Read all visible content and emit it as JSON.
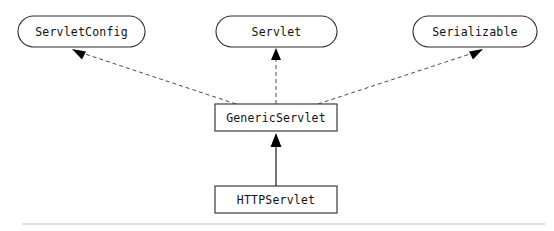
{
  "diagram": {
    "type": "uml-class-hierarchy",
    "canvas": {
      "width": 554,
      "height": 231,
      "background": "#ffffff"
    },
    "colors": {
      "node_stroke": "#2b2b2b",
      "node_fill": "#ffffff",
      "label_text": "#111111",
      "dashed_edge": "#4a4a4a",
      "solid_edge": "#2b2b2b",
      "arrowhead": "#000000",
      "footer_rule": "#b9b9b9"
    },
    "interfaces": [
      {
        "id": "servlet-config",
        "label": "ServletConfig",
        "shape": "rounded-oval",
        "x": 18,
        "y": 16,
        "w": 127,
        "h": 31,
        "cx": 81.5,
        "cy": 31.5
      },
      {
        "id": "servlet",
        "label": "Servlet",
        "shape": "rounded-oval",
        "x": 216,
        "y": 16,
        "w": 121,
        "h": 31,
        "cx": 276.5,
        "cy": 31.5
      },
      {
        "id": "serializable",
        "label": "Serializable",
        "shape": "rounded-oval",
        "x": 413,
        "y": 16,
        "w": 124,
        "h": 31,
        "cx": 475,
        "cy": 31.5
      }
    ],
    "classes": [
      {
        "id": "generic-servlet",
        "label": "GenericServlet",
        "shape": "rectangle",
        "x": 215,
        "y": 104,
        "w": 122,
        "h": 27,
        "cx": 276,
        "cy": 117.5
      },
      {
        "id": "http-servlet",
        "label": "HTTPServlet",
        "shape": "rectangle",
        "x": 215,
        "y": 186,
        "w": 122,
        "h": 27,
        "cx": 276,
        "cy": 199.5
      }
    ],
    "edges": [
      {
        "id": "generic-implements-servletconfig",
        "from": "generic-servlet",
        "to": "servlet-config",
        "style": "dashed",
        "relation": "implements",
        "arrow": "hollow-triangle-filled",
        "x1": 236,
        "y1": 104,
        "x2": 74,
        "y2": 50,
        "arrow_angle": -161
      },
      {
        "id": "generic-implements-servlet",
        "from": "generic-servlet",
        "to": "servlet",
        "style": "dashed",
        "relation": "implements",
        "arrow": "hollow-triangle-filled",
        "x1": 276,
        "y1": 104,
        "x2": 276,
        "y2": 50,
        "arrow_angle": -90
      },
      {
        "id": "generic-implements-serializable",
        "from": "generic-servlet",
        "to": "serializable",
        "style": "dashed",
        "relation": "implements",
        "arrow": "hollow-triangle-filled",
        "x1": 318,
        "y1": 104,
        "x2": 481,
        "y2": 50,
        "arrow_angle": -18
      },
      {
        "id": "http-extends-generic",
        "from": "http-servlet",
        "to": "generic-servlet",
        "style": "solid",
        "relation": "extends",
        "arrow": "triangle-filled",
        "x1": 276,
        "y1": 186,
        "x2": 276,
        "y2": 133,
        "arrow_angle": -90
      }
    ],
    "footer_rule": {
      "x1": 22,
      "y1": 224,
      "x2": 545,
      "y2": 224
    }
  }
}
